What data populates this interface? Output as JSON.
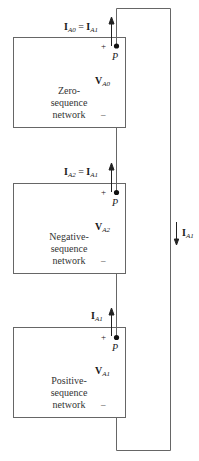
{
  "networks": [
    {
      "name_lines": [
        "Zero-",
        "sequence",
        "network"
      ],
      "current_label": {
        "lhs": "I",
        "lhs_sub": "A0",
        "eq": " = ",
        "rhs": "I",
        "rhs_sub": "A1"
      },
      "voltage_label": {
        "v": "V",
        "sub": "A0"
      },
      "plus": "+",
      "minus": "–",
      "node": "P"
    },
    {
      "name_lines": [
        "Negative-",
        "sequence",
        "network"
      ],
      "current_label": {
        "lhs": "I",
        "lhs_sub": "A2",
        "eq": " = ",
        "rhs": "I",
        "rhs_sub": "A1"
      },
      "voltage_label": {
        "v": "V",
        "sub": "A2"
      },
      "plus": "+",
      "minus": "–",
      "node": "P"
    },
    {
      "name_lines": [
        "Positive-",
        "sequence",
        "network"
      ],
      "current_label": {
        "lhs": "I",
        "lhs_sub": "A1"
      },
      "voltage_label": {
        "v": "V",
        "sub": "A1"
      },
      "plus": "+",
      "minus": "–",
      "node": "P"
    }
  ],
  "loop_current": {
    "i": "I",
    "sub": "A1"
  },
  "colors": {
    "line": "#555555",
    "text": "#1a1a1a"
  }
}
